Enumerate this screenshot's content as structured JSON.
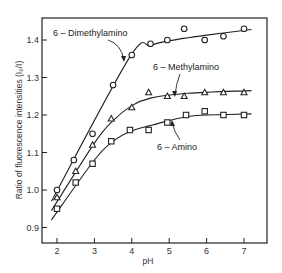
{
  "chart_data": {
    "type": "line",
    "title": "",
    "xlabel": "pH",
    "ylabel": "Ratio of fluorescence intensities (I₀/I)",
    "xlim": [
      1.6,
      7.6
    ],
    "ylim": [
      0.86,
      1.46
    ],
    "xticks": [
      2,
      3,
      4,
      5,
      6,
      7
    ],
    "yticks": [
      0.9,
      1.0,
      1.1,
      1.2,
      1.3,
      1.4
    ],
    "xtick_labels": [
      "2",
      "3",
      "4",
      "5",
      "6",
      "7"
    ],
    "ytick_labels": [
      "0.9",
      "1.0",
      "1.1",
      "1.2",
      "1.3",
      "1.4"
    ],
    "grid": false,
    "legend": "inline annotations with leader arrows",
    "series": [
      {
        "name": "6-Dimethylamino",
        "marker": "circle",
        "x": [
          2.0,
          2.45,
          2.95,
          3.5,
          4.0,
          4.5,
          4.95,
          5.4,
          5.95,
          6.45,
          7.0
        ],
        "values": [
          1.0,
          1.08,
          1.15,
          1.28,
          1.36,
          1.39,
          1.4,
          1.43,
          1.4,
          1.41,
          1.43
        ],
        "fit": [
          [
            1.85,
            0.97
          ],
          [
            3.95,
            1.355
          ],
          [
            4.5,
            1.385
          ],
          [
            5.0,
            1.398
          ],
          [
            6.0,
            1.413
          ],
          [
            7.2,
            1.428
          ]
        ]
      },
      {
        "name": "6-Methylamino",
        "marker": "triangle",
        "x": [
          2.0,
          2.5,
          2.95,
          3.45,
          4.0,
          4.45,
          4.95,
          5.4,
          5.95,
          6.45,
          7.0
        ],
        "values": [
          0.98,
          1.05,
          1.12,
          1.19,
          1.22,
          1.26,
          1.25,
          1.25,
          1.26,
          1.26,
          1.26
        ],
        "fit": [
          [
            1.85,
            0.945
          ],
          [
            3.0,
            1.125
          ],
          [
            3.5,
            1.185
          ],
          [
            4.0,
            1.225
          ],
          [
            4.5,
            1.245
          ],
          [
            5.5,
            1.258
          ],
          [
            7.2,
            1.265
          ]
        ]
      },
      {
        "name": "6-Amino",
        "marker": "square",
        "x": [
          2.0,
          2.5,
          2.95,
          3.45,
          3.95,
          4.45,
          4.95,
          5.45,
          5.95,
          6.45,
          7.0
        ],
        "values": [
          0.95,
          1.02,
          1.07,
          1.13,
          1.16,
          1.16,
          1.18,
          1.2,
          1.21,
          1.2,
          1.2
        ],
        "fit": [
          [
            1.85,
            0.92
          ],
          [
            3.0,
            1.08
          ],
          [
            3.5,
            1.13
          ],
          [
            4.0,
            1.158
          ],
          [
            4.5,
            1.172
          ],
          [
            5.0,
            1.185
          ],
          [
            5.5,
            1.196
          ],
          [
            6.0,
            1.2
          ],
          [
            7.2,
            1.203
          ]
        ]
      }
    ],
    "annotations": [
      {
        "text": "6 – Dimethylamino",
        "series": "6-Dimethylamino"
      },
      {
        "text": "6 – Methylamino",
        "series": "6-Methylamino"
      },
      {
        "text": "6 – Amino",
        "series": "6-Amino"
      }
    ]
  }
}
